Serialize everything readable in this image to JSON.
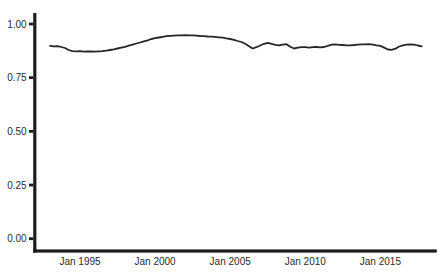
{
  "figure": {
    "background": "#ffffff",
    "text_color": "#2b2b2b",
    "axis_color": "#1c1c1c",
    "line_color": "#262626"
  },
  "chart_data": {
    "type": "line",
    "title": "",
    "xlabel": "",
    "ylabel": "",
    "grid": false,
    "legend": "none",
    "ylim": [
      0.0,
      1.05
    ],
    "xlim_years": [
      1992.6,
      2018.9
    ],
    "x_ticks": [
      {
        "label": "Jan 1995",
        "year": 1995
      },
      {
        "label": "Jan 2000",
        "year": 2000
      },
      {
        "label": "Jan 2005",
        "year": 2005
      },
      {
        "label": "Jan 2010",
        "year": 2010
      },
      {
        "label": "Jan 2015",
        "year": 2015
      }
    ],
    "y_ticks": [
      {
        "label": "0.00",
        "value": 0.0
      },
      {
        "label": "0.25",
        "value": 0.25
      },
      {
        "label": "0.50",
        "value": 0.5
      },
      {
        "label": "0.75",
        "value": 0.75
      },
      {
        "label": "1.00",
        "value": 1.0
      }
    ],
    "series": [
      {
        "name": "proportion-over-time",
        "color": "#262626",
        "x_start_year": 1993.0,
        "x_step_years": 0.25,
        "values": [
          0.898,
          0.896,
          0.897,
          0.893,
          0.888,
          0.879,
          0.874,
          0.873,
          0.874,
          0.871,
          0.873,
          0.872,
          0.871,
          0.873,
          0.874,
          0.876,
          0.879,
          0.882,
          0.886,
          0.89,
          0.894,
          0.899,
          0.904,
          0.909,
          0.914,
          0.919,
          0.924,
          0.93,
          0.934,
          0.937,
          0.94,
          0.943,
          0.945,
          0.946,
          0.947,
          0.947,
          0.948,
          0.947,
          0.947,
          0.946,
          0.944,
          0.943,
          0.942,
          0.941,
          0.94,
          0.938,
          0.936,
          0.933,
          0.93,
          0.926,
          0.921,
          0.916,
          0.908,
          0.896,
          0.886,
          0.892,
          0.9,
          0.908,
          0.912,
          0.908,
          0.903,
          0.901,
          0.904,
          0.906,
          0.894,
          0.886,
          0.89,
          0.892,
          0.892,
          0.89,
          0.892,
          0.893,
          0.891,
          0.893,
          0.898,
          0.904,
          0.905,
          0.903,
          0.902,
          0.901,
          0.901,
          0.902,
          0.904,
          0.905,
          0.905,
          0.906,
          0.904,
          0.901,
          0.898,
          0.89,
          0.881,
          0.88,
          0.885,
          0.895,
          0.901,
          0.904,
          0.905,
          0.904,
          0.9,
          0.896
        ]
      }
    ]
  }
}
